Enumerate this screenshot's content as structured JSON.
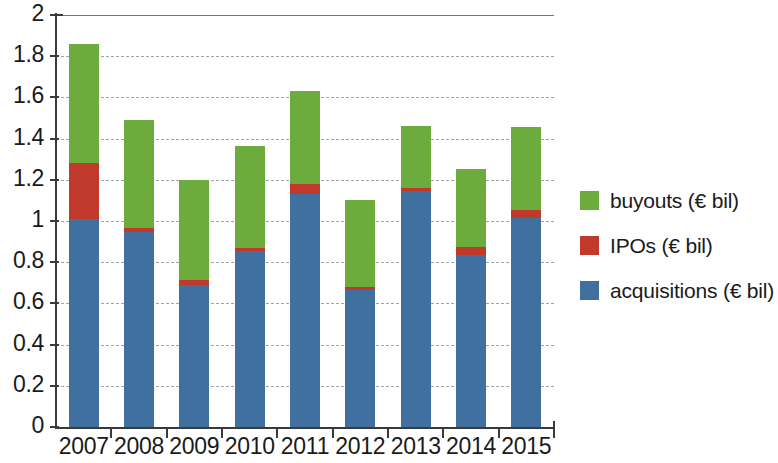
{
  "chart_data": {
    "type": "bar",
    "stacked": true,
    "title": "",
    "subtitle": "",
    "xlabel": "",
    "ylabel": "",
    "categories": [
      "2007",
      "2008",
      "2009",
      "2010",
      "2011",
      "2012",
      "2013",
      "2014",
      "2015"
    ],
    "series": [
      {
        "name": "acquisitions (€ bil)",
        "color": "#40709f",
        "values": [
          1.01,
          0.945,
          0.69,
          0.855,
          1.13,
          0.665,
          1.145,
          0.835,
          1.015
        ]
      },
      {
        "name": "IPOs (€ bil)",
        "color": "#c0392b",
        "values": [
          0.27,
          0.02,
          0.025,
          0.015,
          0.05,
          0.015,
          0.015,
          0.04,
          0.04
        ]
      },
      {
        "name": "buyouts (€ bil)",
        "color": "#6dab3c",
        "values": [
          0.58,
          0.525,
          0.485,
          0.495,
          0.45,
          0.42,
          0.3,
          0.38,
          0.4
        ]
      }
    ],
    "totals": [
      1.86,
      1.49,
      1.2,
      1.365,
      1.63,
      1.1,
      1.46,
      1.255,
      1.455
    ],
    "ylim": [
      0,
      2
    ],
    "ytick_values": [
      0,
      0.2,
      0.4,
      0.6,
      0.8,
      1,
      1.2,
      1.4,
      1.6,
      1.8,
      2
    ],
    "ytick_labels": [
      "0",
      "0.2",
      "0.4",
      "0.6",
      "0.8",
      "1",
      "1.2",
      "1.4",
      "1.6",
      "1.8",
      "2"
    ],
    "grid": true,
    "grid_style": "dashed",
    "legend_position": "right",
    "legend": [
      {
        "label": "buyouts (€ bil)",
        "color": "#6dab3c",
        "swatch": "green-swatch"
      },
      {
        "label": "IPOs (€ bil)",
        "color": "#c0392b",
        "swatch": "red-swatch"
      },
      {
        "label": "acquisitions (€ bil)",
        "color": "#40709f",
        "swatch": "blue-swatch"
      }
    ]
  }
}
